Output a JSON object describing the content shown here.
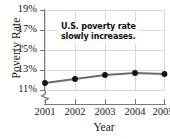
{
  "chart_data": {
    "type": "line",
    "title": "",
    "xlabel": "Year",
    "ylabel": "Poverty Rate",
    "categories": [
      "2001",
      "2002",
      "2003",
      "2004",
      "2005"
    ],
    "x": [
      2001,
      2002,
      2003,
      2004,
      2005
    ],
    "values": [
      11.7,
      12.1,
      12.5,
      12.7,
      12.6
    ],
    "ylim": [
      10.0,
      19.0
    ],
    "xlim": [
      2000.6,
      2005.4
    ],
    "ytick_labels": [
      "11%",
      "13%",
      "15%",
      "17%",
      "19%"
    ],
    "ytick_values": [
      11,
      13,
      15,
      17,
      19
    ],
    "xtick_labels": [
      "2001",
      "2002",
      "2003",
      "2004",
      "2005"
    ],
    "grid": true,
    "legend": "none",
    "axis_break": "y-axis broken below 11%",
    "annotations": [
      {
        "line1": "U.S. poverty rate",
        "line2": "slowly increases."
      }
    ],
    "colors": {
      "line": "#6b6b6b",
      "marker": "#111111",
      "grid": "#d9d9d9",
      "axis": "#7a7a7a",
      "text": "#1a1a1a",
      "background": "#ffffff"
    }
  },
  "artifact": {
    "text": ""
  }
}
